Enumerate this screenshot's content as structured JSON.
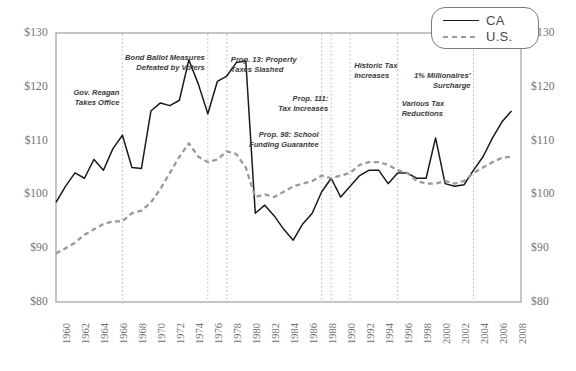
{
  "chart_data": {
    "type": "line",
    "title": "",
    "xlabel": "",
    "ylabel": "",
    "xlim": [
      1960,
      2009
    ],
    "ylim": [
      80,
      130
    ],
    "grid": false,
    "legend_position": "top-right",
    "yticks": [
      "$80",
      "$90",
      "$100",
      "$110",
      "$120",
      "$130"
    ],
    "ytick_values": [
      80,
      90,
      100,
      110,
      120,
      130
    ],
    "xticks": [
      "1960",
      "1962",
      "1964",
      "1966",
      "1968",
      "1970",
      "1972",
      "1974",
      "1976",
      "1978",
      "1980",
      "1982",
      "1984",
      "1986",
      "1988",
      "1990",
      "1992",
      "1994",
      "1996",
      "1998",
      "2000",
      "2002",
      "2004",
      "2006",
      "2008"
    ],
    "x": [
      1960,
      1961,
      1962,
      1963,
      1964,
      1965,
      1966,
      1967,
      1968,
      1969,
      1970,
      1971,
      1972,
      1973,
      1974,
      1975,
      1976,
      1977,
      1978,
      1979,
      1980,
      1981,
      1982,
      1983,
      1984,
      1985,
      1986,
      1987,
      1988,
      1989,
      1990,
      1991,
      1992,
      1993,
      1994,
      1995,
      1996,
      1997,
      1998,
      1999,
      2000,
      2001,
      2002,
      2003,
      2004,
      2005,
      2006,
      2007,
      2008
    ],
    "series": [
      {
        "name": "CA",
        "style": "solid",
        "color": "#1a1a1a",
        "values": [
          98.5,
          101.5,
          104.0,
          103.0,
          106.5,
          104.5,
          108.5,
          111.0,
          105.0,
          104.8,
          115.5,
          117.0,
          116.5,
          117.5,
          125.0,
          120.5,
          115.0,
          121.0,
          122.0,
          124.5,
          124.8,
          96.5,
          98.0,
          96.0,
          93.5,
          91.5,
          94.5,
          96.5,
          100.5,
          103.0,
          99.5,
          101.5,
          103.5,
          104.5,
          104.5,
          102.0,
          104.0,
          104.0,
          103.0,
          103.0,
          110.5,
          102.0,
          101.5,
          101.8,
          104.5,
          107.0,
          110.5,
          113.5,
          115.5
        ]
      },
      {
        "name": "U.S.",
        "style": "dashed",
        "color": "#9a9a9a",
        "values": [
          89.0,
          90.0,
          91.0,
          92.5,
          93.5,
          94.5,
          95.0,
          95.0,
          96.5,
          97.0,
          98.5,
          101.0,
          104.0,
          107.0,
          109.5,
          107.0,
          106.0,
          106.5,
          108.0,
          107.5,
          105.0,
          99.5,
          100.0,
          99.5,
          100.5,
          101.5,
          102.0,
          102.5,
          103.5,
          103.0,
          103.5,
          104.0,
          105.5,
          106.0,
          106.0,
          105.5,
          104.5,
          104.0,
          102.5,
          102.0,
          102.0,
          102.5,
          102.0,
          102.5,
          104.0,
          105.0,
          106.0,
          106.8,
          107.0
        ]
      }
    ],
    "event_markers": [
      {
        "year": 1967,
        "label": "Gov. Reagan\nTakes Office",
        "align": "right",
        "text_x": 0.105,
        "text_y": 0.205
      },
      {
        "year": 1976,
        "label": "Bond Ballot Measures\nDefeated by Voters",
        "align": "right",
        "text_x": 0.2,
        "text_y": 0.075
      },
      {
        "year": 1978,
        "label": "Prop. 13: Property\nTaxes Slashed",
        "align": "left",
        "text_x": 0.413,
        "text_y": 0.08
      },
      {
        "year": 1988,
        "label": "Prop. 98: School\nFunding Guarantee",
        "align": "right",
        "text_x": 0.395,
        "text_y": 0.36
      },
      {
        "year": 1989,
        "label": "Prop. 111:\nTax Increases",
        "align": "right",
        "text_x": 0.48,
        "text_y": 0.225
      },
      {
        "year": 1991,
        "label": "Historic Tax\nIncreases",
        "align": "left",
        "text_x": 0.614,
        "text_y": 0.105
      },
      {
        "year": 1996,
        "label": "Various Tax\nReductions",
        "align": "left",
        "text_x": 0.709,
        "text_y": 0.245
      },
      {
        "year": 2004,
        "label": "1% Millionaires'\nSurcharge",
        "align": "right",
        "text_x": 0.795,
        "text_y": 0.14
      }
    ]
  },
  "legend": {
    "entries": [
      {
        "label": "CA",
        "style": "solid"
      },
      {
        "label": "U.S.",
        "style": "dashed"
      }
    ]
  }
}
